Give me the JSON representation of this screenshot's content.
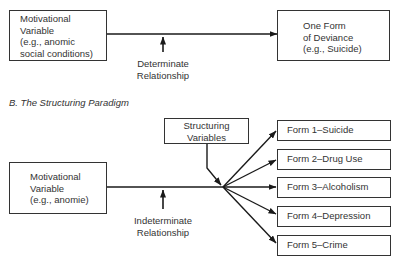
{
  "section_a": {
    "motivational_box": {
      "lines": [
        "Motivational",
        "Variable",
        "(e.g., anomic",
        "social conditions)"
      ]
    },
    "deviance_box": {
      "lines": [
        "One Form",
        "of Deviance",
        "(e.g., Suicide)"
      ]
    },
    "relationship_label": [
      "Determinate",
      "Relationship"
    ]
  },
  "section_b": {
    "title": "B. The Structuring Paradigm",
    "structuring_box": {
      "lines": [
        "Structuring",
        "Variables"
      ]
    },
    "motivational_box": {
      "lines": [
        "Motivational",
        "Variable",
        "(e.g., anomie)"
      ]
    },
    "relationship_label": [
      "Indeterminate",
      "Relationship"
    ],
    "forms": [
      {
        "label": "Form 1–Suicide"
      },
      {
        "label": "Form 2–Drug Use"
      },
      {
        "label": "Form 3–Alcoholism"
      },
      {
        "label": "Form 4–Depression"
      },
      {
        "label": "Form 5–Crime"
      }
    ]
  },
  "colors": {
    "line": "#1a1a1a",
    "text": "#333333",
    "background": "#ffffff"
  }
}
